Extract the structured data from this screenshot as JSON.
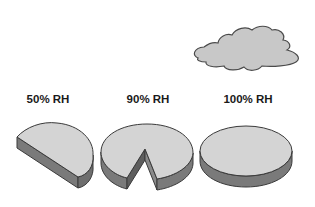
{
  "diagram": {
    "labels": [
      {
        "text": "50% RH",
        "x": 48,
        "y": 93
      },
      {
        "text": "90% RH",
        "x": 148,
        "y": 93
      },
      {
        "text": "100% RH",
        "x": 248,
        "y": 93
      }
    ],
    "icons": {
      "cloud": "cloud-icon",
      "disk_50": "half-disk-icon",
      "disk_90": "notched-disk-icon",
      "disk_100": "full-disk-icon"
    },
    "colors": {
      "top_fill": "#d4d4d4",
      "side_fill": "#7a7a7a",
      "outline": "#3a3a3a",
      "cloud_fill": "#c8c8c8"
    }
  }
}
